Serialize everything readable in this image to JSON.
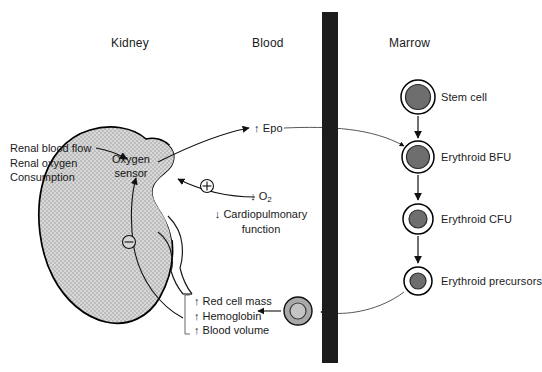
{
  "figure": {
    "background": "#ffffff",
    "ink_color": "#1a1a1a"
  },
  "columns": [
    {
      "id": "kidney",
      "label": "Kidney"
    },
    {
      "id": "blood",
      "label": "Blood"
    },
    {
      "id": "marrow",
      "label": "Marrow"
    }
  ],
  "kidney": {
    "organ_label_line1": "Oxygen",
    "organ_label_line2": "sensor",
    "fill_color": "#c9c9c9",
    "stroke_color": "#000000",
    "inputs": {
      "line1": "Renal blood flow",
      "line2": "Renal oxygen",
      "line3": "Consumption"
    },
    "negative_sign": "⊖",
    "positive_sign": "⊕"
  },
  "blood": {
    "epo_label": "↑ Epo",
    "hypoxia_line1": "↓ O",
    "hypoxia_line1_sub": "2",
    "hypoxia_line2": "↓ Cardiopulmonary",
    "hypoxia_line3": "function",
    "vessel_color": "#1c1c1c",
    "outcomes": {
      "line1": "↑ Red cell mass",
      "line2": "↑ Hemoglobin",
      "line3": "↑ Blood volume"
    },
    "red_cell_name": "red-blood-cell"
  },
  "marrow": {
    "cells": [
      {
        "id": "stem-cell",
        "label": "Stem cell",
        "outer_radius": 17,
        "nucleus_radius": 12.5,
        "cy": 97
      },
      {
        "id": "erythroid-bfu",
        "label": "Erythroid BFU",
        "outer_radius": 16,
        "nucleus_radius": 11.5,
        "cy": 157
      },
      {
        "id": "erythroid-cfu",
        "label": "Erythroid CFU",
        "outer_radius": 15,
        "nucleus_radius": 9,
        "cy": 219
      },
      {
        "id": "erythroid-precursors",
        "label": "Erythroid precursors",
        "outer_radius": 14,
        "nucleus_radius": 8,
        "cy": 281
      }
    ],
    "nucleus_color": "#6e6e6e",
    "ring_color": "#000000"
  }
}
